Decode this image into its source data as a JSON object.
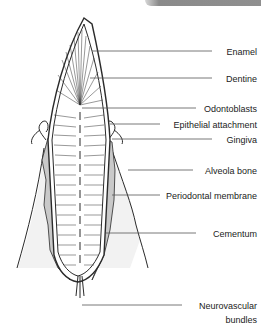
{
  "figure": {
    "labels": [
      {
        "id": "enamel",
        "text": "Enamel",
        "y": 47
      },
      {
        "id": "dentine",
        "text": "Dentine",
        "y": 74
      },
      {
        "id": "odontoblasts",
        "text": "Odontoblasts",
        "y": 104
      },
      {
        "id": "epithelial-attachment",
        "text": "Epithelial attachment",
        "y": 120
      },
      {
        "id": "gingiva",
        "text": "Gingiva",
        "y": 135
      },
      {
        "id": "alveola-bone",
        "text": "Alveola bone",
        "y": 166
      },
      {
        "id": "periodontal-membrane",
        "text": "Periodontal membrane",
        "y": 191
      },
      {
        "id": "cementum",
        "text": "Cementum",
        "y": 229
      },
      {
        "id": "neurovascular-bundles",
        "text": "Neurovascular",
        "text2": "bundles",
        "y": 301
      }
    ],
    "colors": {
      "line": "#2a2a2a",
      "leader": "#555555",
      "gum_fill": "#c9c9c9",
      "bone_fill": "#f2f2f2"
    }
  }
}
